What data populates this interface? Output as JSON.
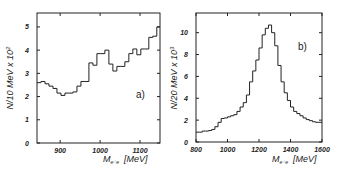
{
  "chart_data": [
    {
      "type": "histogram",
      "panel_label": "a)",
      "title": "",
      "xlabel": "M_ee [MeV]",
      "xlabel_main": "M",
      "xlabel_sub": "e⁺e⁻",
      "xlabel_unit": "[MeV]",
      "ylabel": "N/10 MeV x 10²",
      "ylabel_main": "N/10 MeV  x 10",
      "ylabel_exp": "2",
      "xlim": [
        842,
        1150
      ],
      "ylim": [
        0,
        5.6
      ],
      "xticks": [
        900,
        1000,
        1100
      ],
      "yticks": [
        0,
        1,
        2,
        3,
        4,
        5
      ],
      "bin_width": 10,
      "bin_edges": [
        842,
        852,
        862,
        872,
        882,
        892,
        902,
        912,
        922,
        932,
        942,
        952,
        962,
        972,
        982,
        992,
        1002,
        1012,
        1022,
        1032,
        1042,
        1052,
        1062,
        1072,
        1082,
        1092,
        1102,
        1112,
        1122,
        1132,
        1142,
        1150
      ],
      "values": [
        2.6,
        2.65,
        2.55,
        2.45,
        2.35,
        2.15,
        2.05,
        2.15,
        2.15,
        2.2,
        2.45,
        2.65,
        2.65,
        3.45,
        3.35,
        3.85,
        3.85,
        4.0,
        3.4,
        3.1,
        3.3,
        3.3,
        3.5,
        3.85,
        4.05,
        3.8,
        4.05,
        4.05,
        4.55,
        4.6,
        5.0
      ],
      "grid": false
    },
    {
      "type": "histogram",
      "panel_label": "b)",
      "title": "",
      "xlabel": "M_ee [MeV]",
      "xlabel_main": "M",
      "xlabel_sub": "e⁺e⁻",
      "xlabel_unit": "[MeV]",
      "ylabel": "N/20 MeV x 10³",
      "ylabel_main": "N/20 MeV  x 10",
      "ylabel_exp": "3",
      "xlim": [
        800,
        1600
      ],
      "ylim": [
        0,
        11.8
      ],
      "xticks": [
        800,
        1000,
        1200,
        1400,
        1600
      ],
      "yticks": [
        0,
        2,
        4,
        6,
        8,
        10
      ],
      "bin_width": 20,
      "bin_edges": [
        800,
        820,
        840,
        860,
        880,
        900,
        920,
        940,
        960,
        980,
        1000,
        1020,
        1040,
        1060,
        1080,
        1100,
        1120,
        1140,
        1160,
        1180,
        1200,
        1220,
        1240,
        1260,
        1280,
        1300,
        1320,
        1340,
        1360,
        1380,
        1400,
        1420,
        1440,
        1460,
        1480,
        1500,
        1520,
        1540,
        1560,
        1580,
        1600
      ],
      "values": [
        0.9,
        0.9,
        1.0,
        1.0,
        1.05,
        1.15,
        1.4,
        1.8,
        2.15,
        2.2,
        2.3,
        2.4,
        2.5,
        2.8,
        3.2,
        3.6,
        4.3,
        5.5,
        6.5,
        7.5,
        8.6,
        9.8,
        10.4,
        10.7,
        10.0,
        8.8,
        7.0,
        5.5,
        4.5,
        3.8,
        3.2,
        2.8,
        2.6,
        2.4,
        2.2,
        2.05,
        1.95,
        1.85,
        1.8,
        1.8
      ],
      "grid": false
    }
  ]
}
